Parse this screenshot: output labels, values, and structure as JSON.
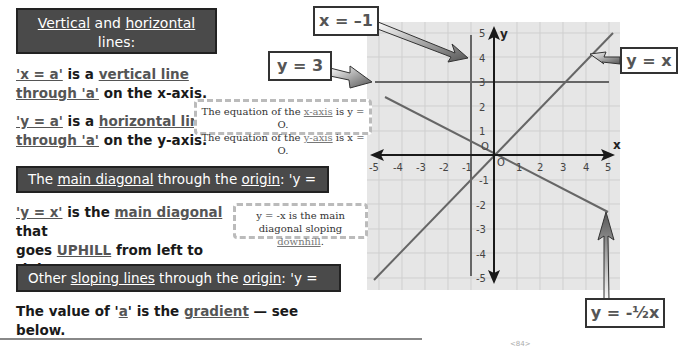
{
  "section1": {
    "header_line1_parts": [
      "Vertical",
      " and ",
      "horizontal",
      " lines:"
    ],
    "header_line2": "'x = a' and 'y = a'",
    "para1": {
      "u1": "'x = a'",
      "t1": " is a ",
      "u2": "vertical line",
      "u3": "through 'a'",
      "t2": " on the x-axis."
    },
    "para2": {
      "u1": "'y = a'",
      "t1": " is a ",
      "u2": "horizontal line",
      "u3": "through 'a'",
      "t2": " on the y-axis."
    }
  },
  "section2": {
    "header_parts": [
      "The ",
      "main diagonal",
      " through the ",
      "origin",
      ": 'y = x'"
    ],
    "para": {
      "u1": "'y = x'",
      "t1": " is the ",
      "u2": "main diagonal",
      "t2": " that",
      "t3": "goes ",
      "u3": "UPHILL",
      "t4": " from left to right."
    }
  },
  "section3": {
    "header_parts": [
      "Other ",
      "sloping lines",
      " through the ",
      "origin",
      ": 'y = ax'"
    ],
    "para": {
      "t1": "The value of '",
      "u1": "a",
      "t2": "' is the ",
      "u2": "gradient",
      "t3": " — see below."
    }
  },
  "notes": {
    "axes_note": {
      "line1_pre": "The equation of the ",
      "line1_u": "x-axis",
      "line1_post": " is y = O.",
      "line2_pre": "The equation of the ",
      "line2_u": "y-axis",
      "line2_post": " is x = O."
    },
    "diag_note": {
      "line1": "y = -x is the main",
      "line2_pre": "diagonal sloping ",
      "line2_u": "downhill",
      "line2_post": "."
    }
  },
  "graph": {
    "x_label": "x",
    "y_label": "y",
    "x_ticks": [
      "-5",
      "-4",
      "-3",
      "-2",
      "-1",
      "O",
      "1",
      "2",
      "3",
      "4",
      "5"
    ],
    "y_ticks": [
      "5",
      "4",
      "3",
      "2",
      "1",
      "O",
      "-1",
      "-2",
      "-3",
      "-4",
      "-5"
    ],
    "line_labels": {
      "x_eq_minus1": "x = –1",
      "y_eq_3": "y = 3",
      "y_eq_x": "y = x",
      "y_eq_minus_half_x": "y = -½x"
    }
  },
  "footer": {
    "mark": "<84>"
  },
  "colors": {
    "header_bg": "#4a4a4a",
    "grid_bg": "#e6e6e6",
    "grid_line": "#cfcfcf",
    "plot_line": "#666666",
    "axis": "#1a1a1a"
  }
}
